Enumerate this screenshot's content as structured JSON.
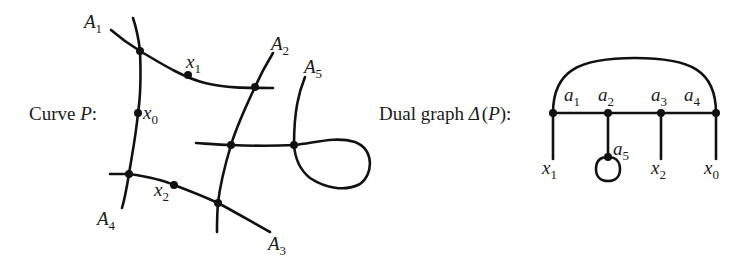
{
  "left": {
    "caption": "Curve P:",
    "caption_prefix": "Curve ",
    "caption_var": "P",
    "caption_suffix": ":",
    "components": [
      {
        "name": "A",
        "sub": "1"
      },
      {
        "name": "A",
        "sub": "2"
      },
      {
        "name": "A",
        "sub": "3"
      },
      {
        "name": "A",
        "sub": "4"
      },
      {
        "name": "A",
        "sub": "5"
      }
    ],
    "marked_points": [
      {
        "name": "x",
        "sub": "0"
      },
      {
        "name": "x",
        "sub": "1"
      },
      {
        "name": "x",
        "sub": "2"
      }
    ]
  },
  "right": {
    "caption_prefix": "Dual graph ",
    "caption_delta": "Δ",
    "caption_open": "(",
    "caption_var": "P",
    "caption_close": "):",
    "vertices": [
      {
        "name": "a",
        "sub": "1"
      },
      {
        "name": "a",
        "sub": "2"
      },
      {
        "name": "a",
        "sub": "3"
      },
      {
        "name": "a",
        "sub": "4"
      },
      {
        "name": "a",
        "sub": "5"
      }
    ],
    "legs": [
      {
        "name": "x",
        "sub": "1"
      },
      {
        "name": "x",
        "sub": "2"
      },
      {
        "name": "x",
        "sub": "0"
      }
    ]
  },
  "colors": {
    "ink": "#111111",
    "background": "#ffffff"
  }
}
